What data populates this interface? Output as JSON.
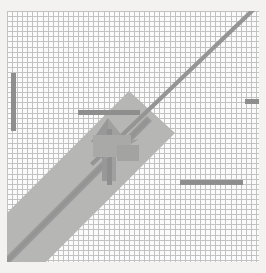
{
  "app": {
    "name": "grid-drawing-canvas",
    "title": "",
    "background_color": "#f3f2f0"
  },
  "canvas": {
    "name": "graph-paper-canvas",
    "x": 7,
    "y": 11,
    "width": 252,
    "height": 251,
    "background_color": "#fbfbfb",
    "grid": {
      "visible": true,
      "cell_size_px": 5,
      "line_color": "#b9b9b9",
      "columns": 50,
      "rows": 49
    }
  },
  "palette": {
    "grid_line": "#b9b9b9",
    "dark_mark": "#8e8e8e",
    "mid_mark": "#9a9a9a",
    "band_fill": "#b6b6b4",
    "paper": "#fbfbfb",
    "page": "#f3f2f0"
  },
  "shapes": [
    {
      "id": "diagonal-line",
      "name": "diagonal-line-upright",
      "type": "line",
      "color": "#8e8e8e",
      "from": {
        "x": 95,
        "y": 160
      },
      "to": {
        "x": 250,
        "y": 15
      },
      "thickness_px": 4,
      "style": "stair-stepped"
    },
    {
      "id": "diagonal-band",
      "name": "diagonal-band-fill",
      "type": "band",
      "color": "#b6b6b4",
      "from": {
        "x": 0,
        "y": 255
      },
      "to": {
        "x": 160,
        "y": 105
      },
      "width_px": 58,
      "style": "solid"
    },
    {
      "id": "band-center-line",
      "name": "band-center-diagonal-line",
      "type": "line",
      "color": "#9a9a9a",
      "from": {
        "x": 2,
        "y": 252
      },
      "to": {
        "x": 136,
        "y": 118
      },
      "thickness_px": 5,
      "style": "stair-stepped"
    },
    {
      "id": "cursor-arrow",
      "name": "cursor-arrow-pointer",
      "type": "arrow",
      "color": "#9d9d9d",
      "tip": {
        "x": 108,
        "y": 118
      },
      "tail": {
        "x": 118,
        "y": 176
      },
      "direction": "up"
    },
    {
      "id": "left-vertical-bar",
      "name": "left-vertical-bar-mark",
      "type": "rect",
      "color": "#8e8e8e",
      "x": 11,
      "y": 73,
      "width": 5,
      "height": 58
    },
    {
      "id": "top-horizontal-bar",
      "name": "top-horizontal-bar-mark",
      "type": "rect",
      "color": "#8e8e8e",
      "x": 78,
      "y": 110,
      "width": 62,
      "height": 5
    },
    {
      "id": "right-edge-dash",
      "name": "right-edge-dash-mark",
      "type": "rect",
      "color": "#8e8e8e",
      "x": 245,
      "y": 99,
      "width": 14,
      "height": 5
    },
    {
      "id": "bottom-right-bar",
      "name": "bottom-right-horizontal-bar-mark",
      "type": "rect",
      "color": "#8e8e8e",
      "x": 180,
      "y": 180,
      "width": 63,
      "height": 5
    }
  ],
  "labels": {
    "none_visible": ""
  }
}
